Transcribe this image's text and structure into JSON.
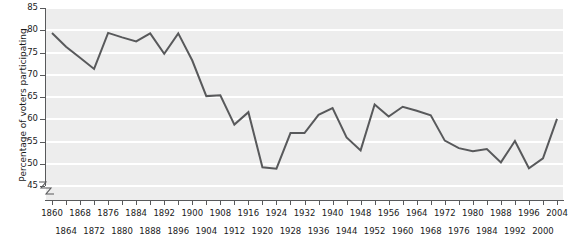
{
  "chart_data": {
    "type": "line",
    "title": "",
    "xlabel": "",
    "ylabel": "Percentage of voters participating",
    "xlim": [
      1860,
      2004
    ],
    "ylim": [
      45,
      85
    ],
    "yticks": [
      45,
      50,
      55,
      60,
      65,
      70,
      75,
      80,
      85
    ],
    "axis_break": true,
    "grid": true,
    "legend": "none",
    "line_color": "#58595b",
    "plot_background": "#ededed",
    "gridline_color": "#ffffff",
    "xticks_top": [
      1860,
      1868,
      1876,
      1884,
      1892,
      1900,
      1908,
      1916,
      1924,
      1932,
      1940,
      1948,
      1956,
      1964,
      1972,
      1980,
      1988,
      1996,
      2004
    ],
    "xticks_bottom": [
      1864,
      1872,
      1880,
      1888,
      1896,
      1904,
      1912,
      1920,
      1928,
      1936,
      1944,
      1952,
      1960,
      1968,
      1976,
      1984,
      1992,
      2000
    ],
    "x": [
      1860,
      1864,
      1868,
      1872,
      1876,
      1880,
      1884,
      1888,
      1892,
      1896,
      1900,
      1904,
      1908,
      1912,
      1916,
      1920,
      1924,
      1928,
      1932,
      1936,
      1940,
      1944,
      1948,
      1952,
      1956,
      1960,
      1964,
      1968,
      1972,
      1976,
      1980,
      1984,
      1988,
      1992,
      1996,
      2000,
      2004
    ],
    "values": [
      79.4,
      76.3,
      73.8,
      71.3,
      79.4,
      78.4,
      77.5,
      79.3,
      74.7,
      79.3,
      73.2,
      65.2,
      65.4,
      58.8,
      61.6,
      49.2,
      48.9,
      56.9,
      56.9,
      61.0,
      62.5,
      55.9,
      53.0,
      63.3,
      60.6,
      62.8,
      61.9,
      60.9,
      55.2,
      53.5,
      52.8,
      53.3,
      50.3,
      55.1,
      49.0,
      51.2,
      60.1
    ]
  }
}
